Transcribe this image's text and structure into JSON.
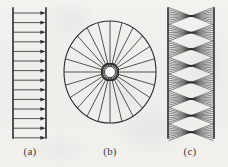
{
  "figure": {
    "width": 228,
    "height": 167,
    "background_color": "#f2f0ec",
    "ink_color": "#2b2b2b"
  },
  "labels": {
    "a": "(a)",
    "b": "(b)",
    "c": "(c)"
  },
  "panels": [
    {
      "id": "panel-a",
      "label": "(a)",
      "name": "parallel-beam-panel",
      "type": "parallel",
      "left_wall_x": 13,
      "right_wall_x": 46,
      "wall_top_y": 8,
      "wall_bottom_y": 138,
      "arrow_count": 14,
      "arrow_first_y": 13,
      "arrow_spacing": 9.6,
      "arrow_direction": "right",
      "line_width": 0.8,
      "wall_width": 1.6
    },
    {
      "id": "panel-b",
      "label": "(b)",
      "name": "radial-beam-panel",
      "type": "radial",
      "center_x": 110,
      "center_y": 72,
      "outer_radius_x": 46,
      "outer_radius_y": 51,
      "hub_radius": 5.5,
      "arrowhead_ring_radius": 11,
      "spoke_count": 24,
      "arrow_direction": "inward",
      "line_width": 0.8,
      "rim_width": 1.1
    },
    {
      "id": "panel-c",
      "label": "(c)",
      "name": "focused-crossing-beam-panel",
      "type": "focused",
      "left_wall_x": 168,
      "right_wall_x": 214,
      "wall_top_y": 8,
      "wall_bottom_y": 138,
      "focus_count": 8,
      "first_focus_y": 16,
      "focus_spacing": 16.6,
      "focus_center_x": 191,
      "rays_per_focus": 9,
      "ray_fan_half_height": 8.5,
      "line_width": 0.55,
      "wall_width": 1.6
    }
  ]
}
